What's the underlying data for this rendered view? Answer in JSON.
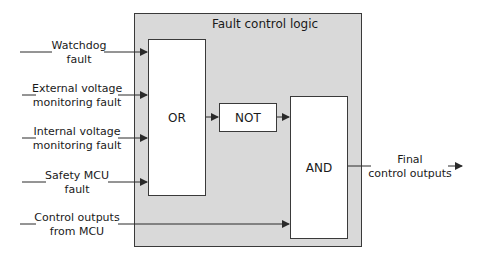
{
  "diagram": {
    "container_title": "Fault control logic",
    "inputs": [
      {
        "line1": "Watchdog",
        "line2": "fault"
      },
      {
        "line1": "External voltage",
        "line2": "monitoring fault"
      },
      {
        "line1": "Internal voltage",
        "line2": "monitoring fault"
      },
      {
        "line1": "Safety MCU",
        "line2": "fault"
      },
      {
        "line1": "Control outputs",
        "line2": "from MCU"
      }
    ],
    "gates": {
      "or": "OR",
      "not": "NOT",
      "and": "AND"
    },
    "output": {
      "line1": "Final",
      "line2": "control outputs"
    },
    "colors": {
      "container_fill": "#d9d9d9",
      "gate_fill": "#ffffff",
      "line": "#3a3a3a"
    }
  }
}
